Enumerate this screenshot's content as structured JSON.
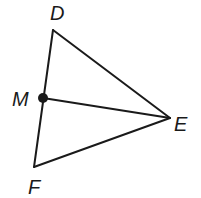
{
  "diagram": {
    "type": "triangle-with-segment",
    "points": {
      "D": {
        "label": "D",
        "x": 53,
        "y": 30
      },
      "M": {
        "label": "M",
        "x": 43,
        "y": 98
      },
      "F": {
        "label": "F",
        "x": 34,
        "y": 167
      },
      "E": {
        "label": "E",
        "x": 170,
        "y": 118
      }
    },
    "segments": [
      "DE",
      "EF",
      "FD",
      "ME"
    ],
    "marked_point": "M",
    "colors": {
      "stroke": "#1a1a1a",
      "background": "#ffffff"
    }
  }
}
